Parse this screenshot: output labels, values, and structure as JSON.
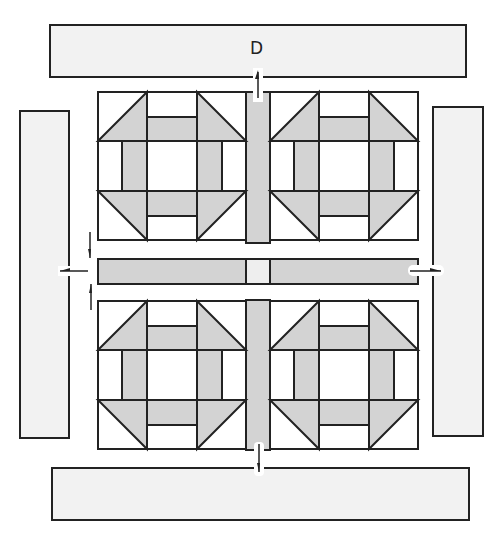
{
  "diagram": {
    "label_top_border": "D",
    "colors": {
      "fabric_gray": "#d3d3d3",
      "border_fabric": "#f2f2f2",
      "cornerstone": "#eeeeee",
      "background_fabric": "#ffffff",
      "outline": "#222222"
    },
    "blocks": [
      {
        "name": "churn-dash-block-top-left"
      },
      {
        "name": "churn-dash-block-top-right"
      },
      {
        "name": "churn-dash-block-bottom-left"
      },
      {
        "name": "churn-dash-block-bottom-right"
      }
    ],
    "borders": [
      "top",
      "left",
      "right",
      "bottom"
    ],
    "arrows": [
      "top-border-up",
      "left-border-left",
      "right-border-right",
      "bottom-border-down",
      "sashing-down",
      "sashing-up"
    ]
  }
}
